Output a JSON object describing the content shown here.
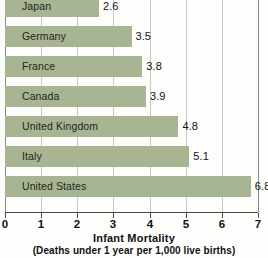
{
  "chart_data": {
    "type": "bar",
    "orientation": "horizontal",
    "title": "Infant Mortality",
    "subtitle": "(Deaths under 1 year per 1,000 live births)",
    "xlabel": "Infant Mortality",
    "ylabel": "",
    "xlim": [
      0,
      7
    ],
    "grid": true,
    "legend": null,
    "categories": [
      "Japan",
      "Germany",
      "France",
      "Canada",
      "United Kingdom",
      "Italy",
      "United States"
    ],
    "values": [
      2.6,
      3.5,
      3.8,
      3.9,
      4.8,
      5.1,
      6.8
    ],
    "value_labels": [
      "2.6",
      "3.5",
      "3.8",
      "3.9",
      "4.8",
      "5.1",
      "6.8"
    ],
    "xticks": [
      0,
      1,
      2,
      3,
      4,
      5,
      6,
      7
    ],
    "xtick_labels": [
      "0",
      "1",
      "2",
      "3",
      "4",
      "5",
      "6",
      "7"
    ],
    "bar_color": "#a8b592",
    "grid_color": "#c9c9c4",
    "axis_color": "#4a4a46",
    "background": "#fdfdfc"
  },
  "bars": [
    {
      "label": "Japan",
      "value": 2.6,
      "value_label": "2.6"
    },
    {
      "label": "Germany",
      "value": 3.5,
      "value_label": "3.5"
    },
    {
      "label": "France",
      "value": 3.8,
      "value_label": "3.8"
    },
    {
      "label": "Canada",
      "value": 3.9,
      "value_label": "3.9"
    },
    {
      "label": "United Kingdom",
      "value": 4.8,
      "value_label": "4.8"
    },
    {
      "label": "Italy",
      "value": 5.1,
      "value_label": "5.1"
    },
    {
      "label": "United States",
      "value": 6.8,
      "value_label": "6.8"
    }
  ],
  "axis": {
    "title": "Infant Mortality",
    "subtitle": "(Deaths under 1 year per 1,000 live births)",
    "ticks": [
      "0",
      "1",
      "2",
      "3",
      "4",
      "5",
      "6",
      "7"
    ]
  }
}
